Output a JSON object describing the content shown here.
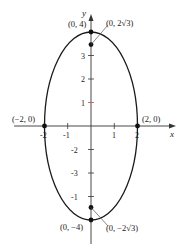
{
  "diagram": {
    "type": "ellipse-graph",
    "equation_form": "x^2/4 + y^2/16 = 1",
    "axes": {
      "x_label": "x",
      "y_label": "y",
      "x_ticks": [
        "-2",
        "-1",
        "1",
        "2"
      ],
      "y_ticks": [
        "-3",
        "-2",
        "-1",
        "1",
        "2",
        "3"
      ]
    },
    "points": [
      {
        "label": "(0, 4)",
        "x": 0,
        "y": 4
      },
      {
        "label": "(0, 2√3)",
        "x": 0,
        "y": 3.464
      },
      {
        "label": "(−2, 0)",
        "x": -2,
        "y": 0
      },
      {
        "label": "(2, 0)",
        "x": 2,
        "y": 0
      },
      {
        "label": "(0, −4)",
        "x": 0,
        "y": -4
      },
      {
        "label": "(0, −2√3)",
        "x": 0,
        "y": -3.464
      }
    ],
    "colors": {
      "curve": "#1a1a1a",
      "axis": "#333333",
      "highlight_tick": "#d9534f"
    }
  }
}
